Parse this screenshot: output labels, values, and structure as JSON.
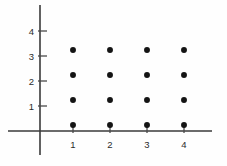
{
  "figure": {
    "background_color": "#fefefe",
    "ink_color": "#141414",
    "axis_color": "#3a3a3a"
  },
  "chart_data": {
    "type": "scatter",
    "title": "",
    "subtitle": "",
    "xlabel": "",
    "ylabel": "",
    "xlim": [
      0,
      4.8
    ],
    "ylim": [
      0,
      5.2
    ],
    "grid": false,
    "legend": null,
    "xticks": [
      1,
      2,
      3,
      4
    ],
    "yticks": [
      1,
      2,
      3,
      4
    ],
    "xtick_labels": [
      "1",
      "2",
      "3",
      "4"
    ],
    "ytick_labels": [
      "1",
      "2",
      "3",
      "4"
    ],
    "marker": "filled-circle",
    "marker_color": "#141414",
    "marker_size": 4,
    "x": [
      1,
      2,
      3,
      4,
      1,
      2,
      3,
      4,
      1,
      2,
      3,
      4,
      1,
      2,
      3,
      4
    ],
    "y": [
      1,
      1,
      1,
      1,
      2,
      2,
      2,
      2,
      3,
      3,
      3,
      3,
      4,
      4,
      4,
      4
    ],
    "points": [
      {
        "x": 1,
        "y": 1
      },
      {
        "x": 2,
        "y": 1
      },
      {
        "x": 3,
        "y": 1
      },
      {
        "x": 4,
        "y": 1
      },
      {
        "x": 1,
        "y": 2
      },
      {
        "x": 2,
        "y": 2
      },
      {
        "x": 3,
        "y": 2
      },
      {
        "x": 4,
        "y": 2
      },
      {
        "x": 1,
        "y": 3
      },
      {
        "x": 2,
        "y": 3
      },
      {
        "x": 3,
        "y": 3
      },
      {
        "x": 4,
        "y": 3
      },
      {
        "x": 1,
        "y": 4
      },
      {
        "x": 2,
        "y": 4
      },
      {
        "x": 3,
        "y": 4
      },
      {
        "x": 4,
        "y": 4
      }
    ]
  },
  "labels": {
    "x": [
      "1",
      "2",
      "3",
      "4"
    ],
    "y": [
      "4",
      "3",
      "2",
      "1"
    ]
  }
}
